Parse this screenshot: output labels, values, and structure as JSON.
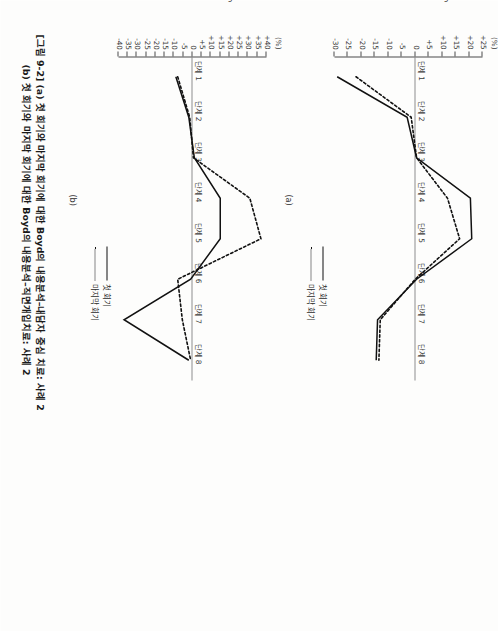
{
  "figure": {
    "caption_line1": "[그림 9-2] (a) 첫 회기와 마지막 회기에 대한 Boyd의 내용분석–내담자 중심 치료: 사례 2",
    "caption_line2": "(b) 첫 회기와 마지막 회기에 대한 Boyd의 내용분석–직면개입치료: 사례 2",
    "panel_a_letter": "(a)",
    "panel_b_letter": "(b)"
  },
  "legend": {
    "first_session": "첫 회기",
    "last_session": "마지막 회기"
  },
  "colors": {
    "line": "#111111",
    "axis": "#4a4a4a",
    "text": "#2a2a2a",
    "background": "#ffffff"
  },
  "chart_data": [
    {
      "id": "panel-a",
      "type": "line",
      "title": "(a) 첫 회기와 마지막 회기에 대한 Boyd의 내용분석–내담자 중심 치료: 사례 2",
      "xlabel": "",
      "ylabel": "Percentage",
      "yunit": "(%)",
      "categories": [
        "단계 1",
        "단계 2",
        "단계 3",
        "단계 4",
        "단계 5",
        "단계 6",
        "단계 7",
        "단계 8"
      ],
      "yticks": [
        "+25",
        "+20",
        "+15",
        "+10",
        "+5",
        "0",
        "-5",
        "-10",
        "-15",
        "-20",
        "-25",
        "-30"
      ],
      "ytickvalues": [
        25,
        20,
        15,
        10,
        5,
        0,
        -5,
        -10,
        -15,
        -20,
        -25,
        -30
      ],
      "ylim": [
        -30,
        25
      ],
      "grid": false,
      "legend_position": "bottom-right",
      "series": [
        {
          "name": "첫 회기",
          "style": "solid",
          "values": [
            -29.0,
            -3.0,
            0.5,
            20.5,
            21.0,
            0.5,
            -14.0,
            -14.5
          ]
        },
        {
          "name": "마지막 회기",
          "style": "dotted",
          "values": [
            -22.0,
            -1.5,
            0.5,
            12.0,
            16.5,
            0.0,
            -13.0,
            -13.5
          ]
        }
      ]
    },
    {
      "id": "panel-b",
      "type": "line",
      "title": "(b) 첫 회기와 마지막 회기에 대한 Boyd의 내용분석–직면개입치료: 사례 2",
      "xlabel": "",
      "ylabel": "Percentage",
      "yunit": "(%)",
      "categories": [
        "단계 1",
        "단계 2",
        "단계 3",
        "단계 4",
        "단계 5",
        "단계 6",
        "단계 7",
        "단계 8"
      ],
      "yticks": [
        "+40",
        "+35",
        "+30",
        "+25",
        "+20",
        "+15",
        "+10",
        "+5",
        "0",
        "-5",
        "-10",
        "-15",
        "-20",
        "-25",
        "-30",
        "-35",
        "-40"
      ],
      "ytickvalues": [
        40,
        35,
        30,
        25,
        20,
        15,
        10,
        5,
        0,
        -5,
        -10,
        -15,
        -20,
        -25,
        -30,
        -35,
        -40
      ],
      "ylim": [
        -40,
        40
      ],
      "grid": false,
      "legend_position": "bottom-right",
      "series": [
        {
          "name": "첫 회기",
          "style": "solid",
          "values": [
            -9.0,
            -2.0,
            1.0,
            15.0,
            15.0,
            -1.0,
            -37.0,
            -2.0
          ]
        },
        {
          "name": "마지막 회기",
          "style": "dotted",
          "values": [
            -8.0,
            -1.5,
            0.5,
            31.0,
            37.0,
            -8.0,
            -5.5,
            -1.0
          ]
        }
      ]
    }
  ]
}
